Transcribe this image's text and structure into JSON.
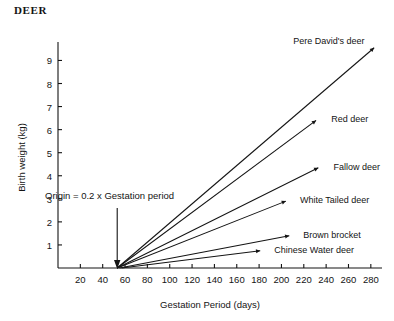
{
  "chart_data": {
    "type": "line",
    "title": "DEER",
    "xlabel": "Gestation Period (days)",
    "ylabel": "Birth weight (kg)",
    "xlim": [
      0,
      290
    ],
    "ylim": [
      0,
      9.8
    ],
    "xticks": [
      20,
      40,
      60,
      80,
      100,
      120,
      140,
      160,
      180,
      200,
      220,
      240,
      260,
      280
    ],
    "yticks": [
      1,
      2,
      3,
      4,
      5,
      6,
      7,
      8,
      9
    ],
    "grid": false,
    "legend": "inline-end-labels",
    "annotation": "Origin  =  0.2 x Gestation period",
    "annotation_arrow_x": 53,
    "series": [
      {
        "name": "Pere David's deer",
        "x": [
          53,
          283
        ],
        "values": [
          0,
          9.55
        ],
        "label_x": 207,
        "label_y": 9.85
      },
      {
        "name": "Red deer",
        "x": [
          53,
          231
        ],
        "values": [
          0,
          6.4
        ],
        "label_x": 241,
        "label_y": 6.45
      },
      {
        "name": "Fallow deer",
        "x": [
          53,
          233
        ],
        "values": [
          0,
          4.35
        ],
        "label_x": 243,
        "label_y": 4.4
      },
      {
        "name": "White Tailed deer",
        "x": [
          53,
          204
        ],
        "values": [
          0,
          2.9
        ],
        "label_x": 213,
        "label_y": 2.95
      },
      {
        "name": "Brown brocket",
        "x": [
          55,
          207
        ],
        "values": [
          0,
          1.4
        ],
        "label_x": 216,
        "label_y": 1.45
      },
      {
        "name": "Chinese Water deer",
        "x": [
          57,
          181
        ],
        "values": [
          0,
          0.75
        ],
        "label_x": 190,
        "label_y": 0.78
      }
    ]
  }
}
